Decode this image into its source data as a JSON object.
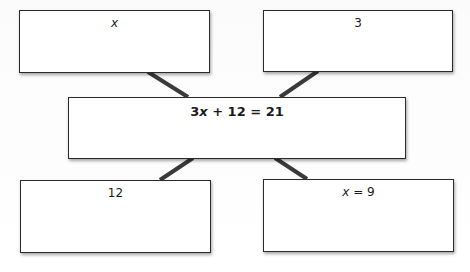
{
  "diagram": {
    "type": "equation-web",
    "center": {
      "equation_parts": {
        "coef": "3",
        "var": "x",
        "rest": " + 12 = 21"
      },
      "equation": "3x + 12 = 21"
    },
    "boxes": {
      "top_left": {
        "var": "x",
        "rest": ""
      },
      "top_right": {
        "label": "3"
      },
      "bottom_left": {
        "label": "12"
      },
      "bottom_right": {
        "var": "x",
        "rest": " = 9"
      }
    },
    "colors": {
      "border": "#2a2a2a",
      "connector": "#3a3a3a",
      "background": "#ffffff"
    }
  }
}
